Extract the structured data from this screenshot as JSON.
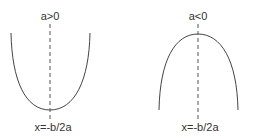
{
  "diagrams": [
    {
      "condition": "a>0",
      "axis_label": "x=-b/2a",
      "shape": "upward parabola",
      "axis_x": 50,
      "label_top_y": 10,
      "label_bottom_y": 121
    },
    {
      "condition": "a<0",
      "axis_label": "x=-b/2a",
      "shape": "downward parabola",
      "axis_x": 198,
      "label_top_y": 10,
      "label_bottom_y": 121
    }
  ],
  "colors": {
    "curve": "#444444",
    "axis": "#555555",
    "text": "#333333"
  }
}
